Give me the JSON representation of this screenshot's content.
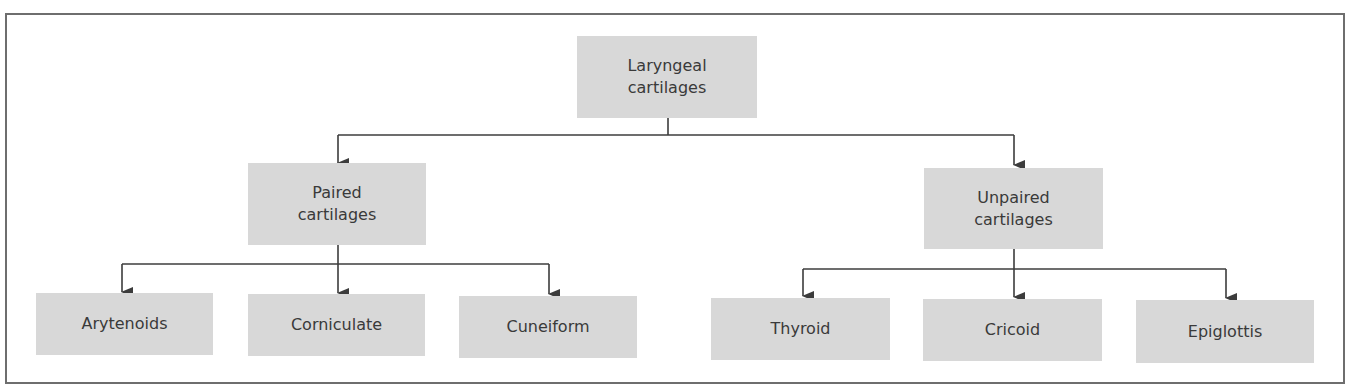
{
  "diagram": {
    "type": "tree",
    "colors": {
      "box_fill": "#d8d8d8",
      "text": "#3a3a3a",
      "line": "#3c3c3c",
      "frame": "#6e6e6e"
    },
    "root": {
      "line1": "Laryngeal",
      "line2": "cartilages"
    },
    "groups": [
      {
        "line1": "Paired",
        "line2": "cartilages",
        "children": [
          "Arytenoids",
          "Corniculate",
          "Cuneiform"
        ]
      },
      {
        "line1": "Unpaired",
        "line2": "cartilages",
        "children": [
          "Thyroid",
          "Cricoid",
          "Epiglottis"
        ]
      }
    ]
  }
}
